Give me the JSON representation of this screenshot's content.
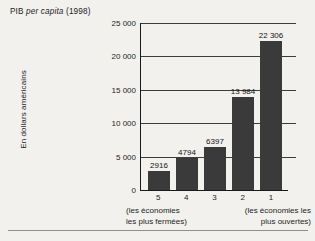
{
  "chart_data": {
    "type": "bar",
    "title": "PIB per capita (1998)",
    "title_plain": "PIB",
    "title_italic": "per capita",
    "title_suffix": "(1998)",
    "xlabel": "",
    "ylabel": "En dollars américains",
    "categories": [
      "5",
      "4",
      "3",
      "2",
      "1"
    ],
    "values": [
      2916,
      4794,
      6397,
      13984,
      22306
    ],
    "value_labels": [
      "2916",
      "4794",
      "6397",
      "13 984",
      "22 306"
    ],
    "ylim": [
      0,
      25000
    ],
    "yticks": [
      0,
      5000,
      10000,
      15000,
      20000,
      25000
    ],
    "ytick_labels": [
      "0",
      "5 000",
      "10 000",
      "15 000",
      "20 000",
      "25 000"
    ],
    "grid": true,
    "legend": null,
    "bar_color": "#3a3a3a",
    "background_color": "#f2f1ee",
    "axis_color": "#1a1a1a",
    "annotations": {
      "x_caption_left": "(les économies\nles plus fermées)",
      "x_caption_right": "(les économies les\nplus ouvertes)"
    }
  }
}
